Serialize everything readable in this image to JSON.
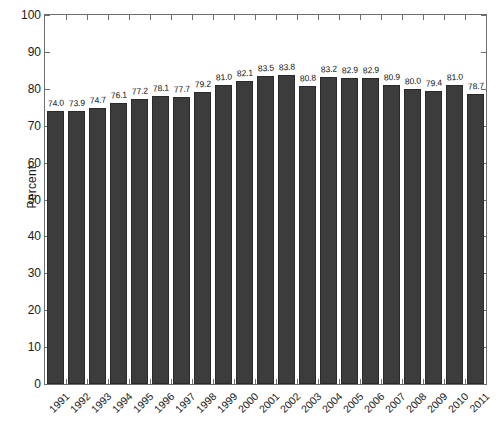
{
  "chart_data": {
    "type": "bar",
    "title": "",
    "subtitle": "",
    "xlabel": "",
    "ylabel": "Percent",
    "ylim": [
      0,
      100
    ],
    "ytick_step": 10,
    "yticks": [
      "0",
      "10",
      "20",
      "30",
      "40",
      "50",
      "60",
      "70",
      "80",
      "90",
      "100"
    ],
    "grid": false,
    "legend": null,
    "bar_color": "#3c3c3c",
    "bar_edge_color": "#2a2a2a",
    "axis_color": "#6e6e6e",
    "background": "#ffffff",
    "value_label_format": "one-decimal",
    "categories": [
      "1991",
      "1992",
      "1993",
      "1994",
      "1995",
      "1996",
      "1997",
      "1998",
      "1999",
      "2000",
      "2001",
      "2002",
      "2003",
      "2004",
      "2005",
      "2006",
      "2007",
      "2008",
      "2009",
      "2010",
      "2011"
    ],
    "values": [
      74.0,
      73.9,
      74.7,
      76.1,
      77.2,
      78.1,
      77.7,
      79.2,
      81.0,
      82.1,
      83.5,
      83.8,
      80.8,
      83.2,
      82.9,
      82.9,
      80.9,
      80.0,
      79.4,
      81.0,
      78.7
    ],
    "value_labels": [
      "74.0",
      "73.9",
      "74.7",
      "76.1",
      "77.2",
      "78.1",
      "77.7",
      "79.2",
      "81.0",
      "82.1",
      "83.5",
      "83.8",
      "80.8",
      "83.2",
      "82.9",
      "82.9",
      "80.9",
      "80.0",
      "79.4",
      "81.0",
      "78.7"
    ]
  }
}
